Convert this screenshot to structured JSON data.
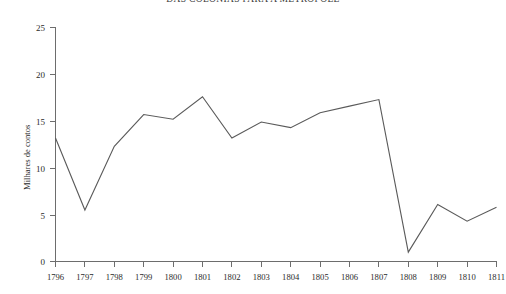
{
  "chart_data": {
    "type": "line",
    "title": "DAS COLÔNIAS PARA A METRÓPOLE",
    "xlabel": "",
    "ylabel": "Milhares de contos",
    "categories": [
      "1796",
      "1797",
      "1798",
      "1799",
      "1800",
      "1801",
      "1802",
      "1803",
      "1804",
      "1805",
      "1806",
      "1807",
      "1808",
      "1809",
      "1810",
      "1811"
    ],
    "values": [
      13.2,
      5.5,
      12.3,
      15.7,
      15.2,
      17.6,
      13.2,
      14.9,
      14.3,
      15.9,
      16.6,
      17.3,
      1.0,
      6.1,
      4.3,
      5.8
    ],
    "ylim": [
      0,
      25
    ],
    "yticks": [
      "0",
      "5",
      "10",
      "15",
      "20",
      "25"
    ],
    "ytick_values": [
      0,
      5,
      10,
      15,
      20,
      25
    ],
    "grid": false,
    "legend": "none",
    "line_color": "#5a5a5a",
    "axis_color": "#6d6d6d",
    "background": "#ffffff"
  }
}
